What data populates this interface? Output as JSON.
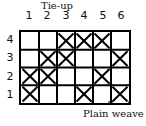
{
  "diagram": {
    "title": "Tie-up",
    "columns": [
      "1",
      "2",
      "3",
      "4",
      "5",
      "6"
    ],
    "rows": [
      "4",
      "3",
      "2",
      "1"
    ],
    "cells": {
      "4": [
        3,
        4,
        5
      ],
      "3": [
        2,
        3,
        6
      ],
      "2": [
        1,
        2,
        5
      ],
      "1": [
        1,
        4,
        6
      ]
    },
    "bracket_columns": [
      5,
      6
    ],
    "caption": "Plain weave",
    "colors": {
      "line": "#000000",
      "background": "#ffffff"
    }
  }
}
